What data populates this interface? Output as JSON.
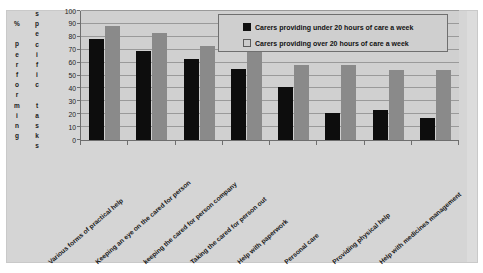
{
  "axis_title": {
    "column_1": "% performing",
    "column_2": "specific tasks"
  },
  "legend": {
    "position": "top-right",
    "entries": [
      {
        "label": "Carers providing under 20 hours of care a week",
        "swatch": "dark-square-icon",
        "color": "#111111"
      },
      {
        "label": "Carers providing over 20 hours of care a week",
        "swatch": "light-square-icon",
        "color": "#cccccc"
      }
    ]
  },
  "chart_data": {
    "type": "bar",
    "title": "",
    "xlabel": "",
    "ylabel": "% performing specific tasks",
    "ylim": [
      0,
      100
    ],
    "yticks": [
      0,
      10,
      20,
      30,
      40,
      50,
      60,
      70,
      80,
      90,
      100
    ],
    "grid": true,
    "categories": [
      "Various forms of practical help",
      "Keeping an eye on the cared for person",
      "keeping the cared for person company",
      "Taking the cared for person out",
      "Help with paperwork",
      "Personal care",
      "Providing physical help",
      "Help with medicines management"
    ],
    "series": [
      {
        "name": "Carers providing under 20 hours of care a week",
        "color": "#0d0d0d",
        "values": [
          78,
          69,
          63,
          55,
          41,
          21,
          23,
          17
        ]
      },
      {
        "name": "Carers providing over 20 hours of care a week",
        "color": "#8a8a8a",
        "values": [
          88,
          83,
          73,
          69,
          58,
          58,
          54,
          54
        ]
      }
    ]
  }
}
